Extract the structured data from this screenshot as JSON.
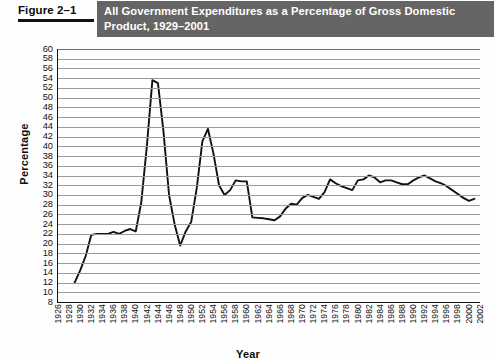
{
  "figure": {
    "label": "Figure 2–1",
    "title": "All Government Expenditures as a Percentage of Gross Domestic Product, 1929–2001",
    "band_color": "#666565",
    "band_text_color": "#ffffff"
  },
  "chart_data": {
    "type": "line",
    "title": "All Government Expenditures as a Percentage of Gross Domestic Product, 1929–2001",
    "xlabel": "Year",
    "ylabel": "Percentage",
    "xlim": [
      1926,
      2002
    ],
    "ylim": [
      8,
      60
    ],
    "ytick_step": 2,
    "xtick_step": 2,
    "grid": true,
    "legend": "none",
    "line_color": "#111111",
    "ytick_labels": [
      60,
      58,
      56,
      54,
      52,
      50,
      48,
      46,
      44,
      42,
      40,
      38,
      36,
      34,
      32,
      30,
      28,
      26,
      24,
      22,
      20,
      18,
      16,
      14,
      12,
      10,
      8
    ],
    "xtick_labels": [
      1926,
      1928,
      1930,
      1932,
      1934,
      1936,
      1938,
      1940,
      1942,
      1944,
      1946,
      1948,
      1950,
      1952,
      1954,
      1956,
      1958,
      1960,
      1962,
      1964,
      1966,
      1968,
      1970,
      1972,
      1974,
      1976,
      1978,
      1980,
      1982,
      1984,
      1986,
      1988,
      1990,
      1992,
      1994,
      1996,
      1998,
      2000,
      2002
    ],
    "x": [
      1929,
      1930,
      1931,
      1932,
      1933,
      1934,
      1935,
      1936,
      1937,
      1938,
      1939,
      1940,
      1941,
      1942,
      1943,
      1944,
      1945,
      1946,
      1947,
      1948,
      1949,
      1950,
      1951,
      1952,
      1953,
      1954,
      1955,
      1956,
      1957,
      1958,
      1959,
      1960,
      1961,
      1962,
      1963,
      1964,
      1965,
      1966,
      1967,
      1968,
      1969,
      1970,
      1971,
      1972,
      1973,
      1974,
      1975,
      1976,
      1977,
      1978,
      1979,
      1980,
      1981,
      1982,
      1983,
      1984,
      1985,
      1986,
      1987,
      1988,
      1989,
      1990,
      1991,
      1992,
      1993,
      1994,
      1995,
      1996,
      1997,
      1998,
      1999,
      2000,
      2001
    ],
    "y": [
      12.0,
      14.5,
      17.5,
      21.8,
      22.0,
      22.0,
      22.0,
      22.4,
      22.0,
      22.6,
      23.0,
      22.5,
      28.5,
      40.0,
      53.6,
      53.0,
      43.0,
      30.0,
      24.0,
      19.6,
      22.5,
      24.5,
      31.5,
      41.0,
      43.6,
      38.5,
      32.0,
      30.0,
      31.0,
      33.0,
      32.8,
      32.8,
      25.4,
      25.3,
      25.2,
      25.0,
      24.8,
      25.6,
      27.2,
      28.2,
      28.0,
      29.4,
      30.0,
      29.6,
      29.2,
      30.6,
      33.2,
      32.4,
      31.8,
      31.4,
      31.0,
      33.0,
      33.2,
      34.0,
      33.6,
      32.6,
      33.0,
      33.0,
      32.6,
      32.2,
      32.2,
      33.0,
      33.6,
      34.0,
      33.4,
      32.8,
      32.4,
      31.8,
      31.0,
      30.2,
      29.4,
      28.8,
      29.2
    ],
    "annotations": [
      {
        "text": "WWII peak",
        "year": 1944,
        "value": 53.6
      },
      {
        "text": "Korean War peak",
        "year": 1953,
        "value": 43.6
      }
    ]
  }
}
